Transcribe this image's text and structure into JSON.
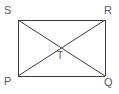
{
  "figure": {
    "type": "geometry-diagram",
    "shape": "rectangle-with-diagonals",
    "background_color": "#ffffff",
    "line_color": "#3c3c3c",
    "label_color": "#5a5a5a",
    "stroke_width": 1,
    "canvas": {
      "width": 119,
      "height": 94
    },
    "rectangle": {
      "top_left": {
        "x": 18,
        "y": 20
      },
      "top_right": {
        "x": 105,
        "y": 20
      },
      "bottom_right": {
        "x": 105,
        "y": 76
      },
      "bottom_left": {
        "x": 18,
        "y": 76
      }
    },
    "diagonals": [
      {
        "name": "SQ",
        "from": {
          "x": 18,
          "y": 20
        },
        "to": {
          "x": 105,
          "y": 76
        }
      },
      {
        "name": "RP",
        "from": {
          "x": 105,
          "y": 20
        },
        "to": {
          "x": 18,
          "y": 76
        }
      }
    ],
    "intersection": {
      "x": 61.5,
      "y": 48
    },
    "vertices": [
      {
        "id": "S",
        "label": "S",
        "position": "top-left"
      },
      {
        "id": "R",
        "label": "R",
        "position": "top-right"
      },
      {
        "id": "P",
        "label": "P",
        "position": "bottom-left"
      },
      {
        "id": "Q",
        "label": "Q",
        "position": "bottom-right"
      }
    ],
    "points": [
      {
        "id": "T",
        "label": "T",
        "position": "center"
      }
    ]
  }
}
